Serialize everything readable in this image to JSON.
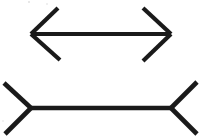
{
  "image": {
    "title": "Muller-Lyer Illusion",
    "background_color": "#ffffff",
    "ink_color": "#1a1a1a",
    "width": 201,
    "height": 140
  },
  "figures": [
    {
      "id": "arrows-in",
      "label": "Top figure: double-headed arrow with inward arrowheads",
      "shaft": {
        "x1": 31,
        "y1": 34,
        "x2": 171,
        "y2": 34
      },
      "stroke_width": 4.2,
      "fins": [
        {
          "name": "left-upper-fin",
          "x1": 31,
          "y1": 34,
          "x2": 58,
          "y2": 8
        },
        {
          "name": "left-lower-fin",
          "x1": 31,
          "y1": 34,
          "x2": 60,
          "y2": 60
        },
        {
          "name": "right-upper-fin",
          "x1": 171,
          "y1": 34,
          "x2": 143,
          "y2": 8
        },
        {
          "name": "right-lower-fin",
          "x1": 171,
          "y1": 34,
          "x2": 143,
          "y2": 61
        }
      ]
    },
    {
      "id": "fins-out",
      "label": "Bottom figure: line with outward pointing fins",
      "shaft": {
        "x1": 31,
        "y1": 108,
        "x2": 171,
        "y2": 108
      },
      "stroke_width": 4.6,
      "fins": [
        {
          "name": "left-upper-fin",
          "x1": 31,
          "y1": 108,
          "x2": 4,
          "y2": 83
        },
        {
          "name": "left-lower-fin",
          "x1": 31,
          "y1": 108,
          "x2": 5,
          "y2": 134
        },
        {
          "name": "right-upper-fin",
          "x1": 171,
          "y1": 108,
          "x2": 197,
          "y2": 82
        },
        {
          "name": "right-lower-fin",
          "x1": 171,
          "y1": 108,
          "x2": 197,
          "y2": 134
        }
      ]
    }
  ],
  "artifacts": [
    {
      "name": "scan-speck-top",
      "x": 28,
      "y": 1,
      "size": 2,
      "opacity": 0.55
    },
    {
      "name": "scan-speck-top-right",
      "x": 46,
      "y": 3,
      "size": 1.5,
      "opacity": 0.35
    },
    {
      "name": "scan-speck-left",
      "x": 2,
      "y": 120,
      "size": 1.5,
      "opacity": 0.3
    }
  ]
}
